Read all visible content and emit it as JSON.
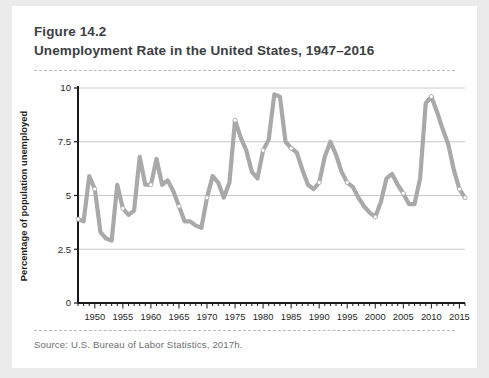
{
  "figure": {
    "number": "Figure 14.2",
    "title": "Unemployment Rate in the United States, 1947–2016",
    "source": "Source: U.S. Bureau of Labor Statistics, 2017h."
  },
  "colors": {
    "page_background": "#ebebeb",
    "card_background": "#ffffff",
    "line": "#a9a9a9",
    "gridline": "#c9c9c9",
    "axis": "#1a1a1a",
    "title_text": "#3c4043",
    "source_text": "#6b6f73",
    "marker_fill": "#ffffff"
  },
  "chart_data": {
    "type": "line",
    "title": "Unemployment Rate in the United States, 1947–2016",
    "xlabel": "",
    "ylabel": "Percentage of population unemployed",
    "xlim": [
      1947,
      2016
    ],
    "ylim": [
      0,
      10
    ],
    "yticks": [
      0,
      2.5,
      5,
      7.5,
      10
    ],
    "ytick_labels": [
      "0",
      "2.5",
      "5",
      "7.5",
      "10"
    ],
    "xticks": [
      1950,
      1955,
      1960,
      1965,
      1970,
      1975,
      1980,
      1985,
      1990,
      1995,
      2000,
      2005,
      2010,
      2015
    ],
    "xtick_labels": [
      "1950",
      "1955",
      "1960",
      "1965",
      "1970",
      "1975",
      "1980",
      "1985",
      "1990",
      "1995",
      "2000",
      "2005",
      "2010",
      "2015"
    ],
    "minor_xtick_interval": 1,
    "grid": "horizontal",
    "legend": "none",
    "marker_years": [
      1947,
      1950,
      1955,
      1960,
      1965,
      1970,
      1975,
      1980,
      1985,
      1990,
      1995,
      2000,
      2005,
      2010,
      2015,
      2016
    ],
    "x": [
      1947,
      1948,
      1949,
      1950,
      1951,
      1952,
      1953,
      1954,
      1955,
      1956,
      1957,
      1958,
      1959,
      1960,
      1961,
      1962,
      1963,
      1964,
      1965,
      1966,
      1967,
      1968,
      1969,
      1970,
      1971,
      1972,
      1973,
      1974,
      1975,
      1976,
      1977,
      1978,
      1979,
      1980,
      1981,
      1982,
      1983,
      1984,
      1985,
      1986,
      1987,
      1988,
      1989,
      1990,
      1991,
      1992,
      1993,
      1994,
      1995,
      1996,
      1997,
      1998,
      1999,
      2000,
      2001,
      2002,
      2003,
      2004,
      2005,
      2006,
      2007,
      2008,
      2009,
      2010,
      2011,
      2012,
      2013,
      2014,
      2015,
      2016
    ],
    "values": [
      3.9,
      3.8,
      5.9,
      5.3,
      3.3,
      3.0,
      2.9,
      5.5,
      4.4,
      4.1,
      4.3,
      6.8,
      5.5,
      5.5,
      6.7,
      5.5,
      5.7,
      5.2,
      4.5,
      3.8,
      3.8,
      3.6,
      3.5,
      4.9,
      5.9,
      5.6,
      4.9,
      5.6,
      8.5,
      7.7,
      7.1,
      6.1,
      5.8,
      7.1,
      7.6,
      9.7,
      9.6,
      7.5,
      7.2,
      7.0,
      6.2,
      5.5,
      5.3,
      5.6,
      6.8,
      7.5,
      6.9,
      6.1,
      5.6,
      5.4,
      4.9,
      4.5,
      4.2,
      4.0,
      4.7,
      5.8,
      6.0,
      5.5,
      5.1,
      4.6,
      4.6,
      5.8,
      9.3,
      9.6,
      8.9,
      8.1,
      7.4,
      6.2,
      5.3,
      4.9
    ],
    "series_name": "Unemployment rate"
  },
  "plot_geometry": {
    "left": 66,
    "right": 453,
    "top": 18,
    "bottom": 233
  }
}
